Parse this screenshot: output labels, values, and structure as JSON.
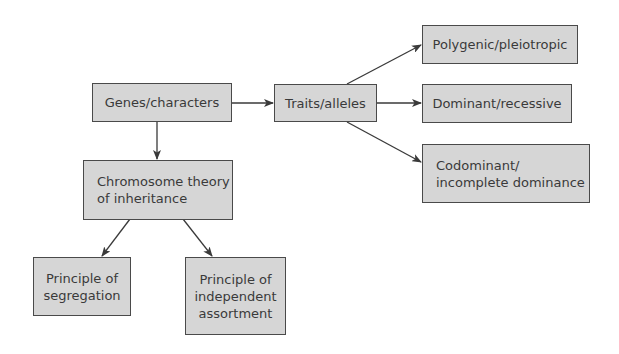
{
  "diagram": {
    "type": "concept map",
    "nodes": {
      "genes": {
        "label": "Genes/characters"
      },
      "traits": {
        "label": "Traits/alleles"
      },
      "polygenic": {
        "label": "Polygenic/pleiotropic"
      },
      "dominant": {
        "label": "Dominant/recessive"
      },
      "codominant": {
        "label": "Codominant/\nincomplete dominance"
      },
      "chromosome": {
        "label": "Chromosome theory\nof inheritance"
      },
      "segregation": {
        "label": "Principle of\nsegregation"
      },
      "independent": {
        "label": "Principle of\nindependent\nassortment"
      }
    },
    "edges": [
      {
        "from": "genes",
        "to": "traits"
      },
      {
        "from": "genes",
        "to": "chromosome"
      },
      {
        "from": "traits",
        "to": "polygenic"
      },
      {
        "from": "traits",
        "to": "dominant"
      },
      {
        "from": "traits",
        "to": "codominant"
      },
      {
        "from": "chromosome",
        "to": "segregation"
      },
      {
        "from": "chromosome",
        "to": "independent"
      }
    ],
    "colors": {
      "box_fill": "#d6d6d6",
      "box_border": "#4a4a4a",
      "arrow": "#3a3a3a",
      "text": "#3a3a3a"
    }
  }
}
